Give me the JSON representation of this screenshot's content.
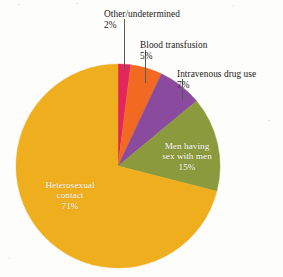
{
  "chart_data": {
    "type": "pie",
    "title": "",
    "subtitle": "",
    "xlabel": "",
    "ylabel": "",
    "legend_position": "none",
    "grid": false,
    "units": "percent",
    "start_angle_deg": 0,
    "direction": "clockwise",
    "categories": [
      "Other/undetermined",
      "Blood transfusion",
      "Intravenous drug use",
      "Men having sex with men",
      "Heterosexual contact"
    ],
    "values": [
      2,
      5,
      7,
      15,
      71
    ],
    "colors": [
      "#e3265b",
      "#f26a21",
      "#8a4a9e",
      "#8a9a3c",
      "#efae1e"
    ],
    "slices": [
      {
        "label": "Other/undetermined",
        "percent_text": "2%",
        "value": 2,
        "color": "#e3265b",
        "label_placement": "outside",
        "label_color": "#1c1a18"
      },
      {
        "label": "Blood transfusion",
        "percent_text": "5%",
        "value": 5,
        "color": "#f26a21",
        "label_placement": "outside",
        "label_color": "#1c1a18"
      },
      {
        "label": "Intravenous drug use",
        "percent_text": "7%",
        "value": 7,
        "color": "#8a4a9e",
        "label_placement": "outside",
        "label_color": "#1c1a18"
      },
      {
        "label": "Men having\nsex with men",
        "label_line1": "Men having",
        "label_line2": "sex with men",
        "percent_text": "15%",
        "value": 15,
        "color": "#8a9a3c",
        "label_placement": "inside",
        "label_color": "#ffffff"
      },
      {
        "label": "Heterosexual\ncontact",
        "label_line1": "Heterosexual",
        "label_line2": "contact",
        "percent_text": "71%",
        "value": 71,
        "color": "#efae1e",
        "label_placement": "inside",
        "label_color": "#ffffff"
      }
    ]
  },
  "callouts": {
    "other": {
      "name": "Other/undetermined",
      "pct": "2%"
    },
    "blood": {
      "name": "Blood transfusion",
      "pct": "5%"
    },
    "ivdrug": {
      "name": "Intravenous drug use",
      "pct": "7%"
    }
  },
  "inside_labels": {
    "msm": {
      "line1": "Men having",
      "line2": "sex with men",
      "pct": "15%"
    },
    "het": {
      "line1": "Heterosexual",
      "line2": "contact",
      "pct": "71%"
    }
  },
  "style": {
    "background": "#fdfdfc",
    "leader_line_color": "#5d5b57"
  }
}
